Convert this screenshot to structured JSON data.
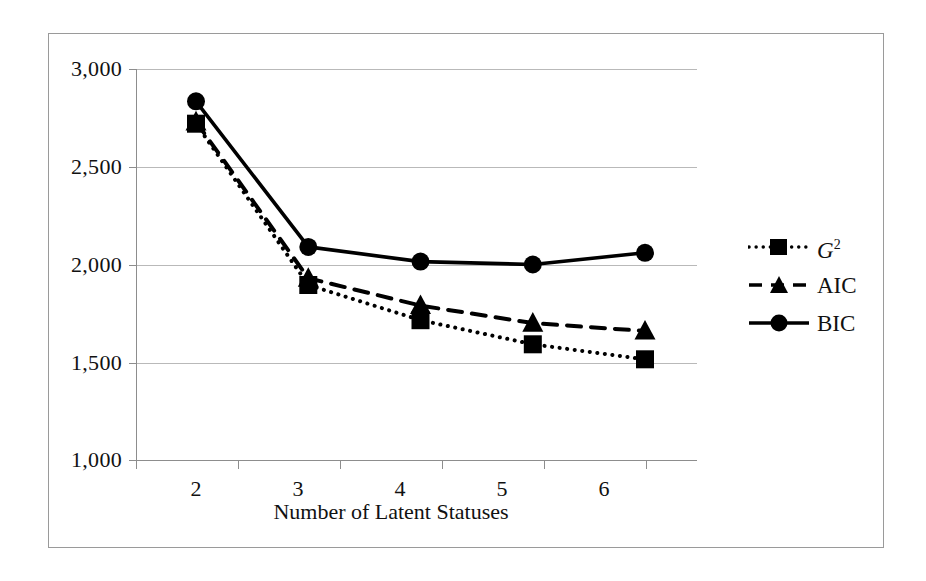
{
  "chart_data": {
    "type": "line",
    "title": "",
    "xlabel": "Number of Latent Statuses",
    "ylabel": "",
    "categories": [
      "2",
      "3",
      "4",
      "5",
      "6"
    ],
    "x": [
      2,
      3,
      4,
      5,
      6
    ],
    "ylim": [
      1000,
      3000
    ],
    "yticks": [
      1000,
      1500,
      2000,
      2500,
      3000
    ],
    "ytick_labels": [
      "1,000",
      "1,500",
      "2,000",
      "2,500",
      "3,000"
    ],
    "xtick_labels": [
      "2",
      "3",
      "4",
      "5",
      "6"
    ],
    "grid": true,
    "legend_position": "right",
    "series": [
      {
        "name": "G2",
        "label": "G",
        "label_superscript": "2",
        "values": [
          2720,
          1895,
          1715,
          1592,
          1515
        ],
        "line_style": "dotted",
        "marker": "square",
        "color": "#000000"
      },
      {
        "name": "AIC",
        "label": "AIC",
        "values": [
          2730,
          1930,
          1790,
          1700,
          1660
        ],
        "line_style": "dashed",
        "marker": "triangle",
        "color": "#000000"
      },
      {
        "name": "BIC",
        "label": "BIC",
        "values": [
          2835,
          2090,
          2015,
          2000,
          2060
        ],
        "line_style": "solid",
        "marker": "circle",
        "color": "#000000"
      }
    ]
  },
  "axis": {
    "y_labels": [
      "3,000",
      "2,500",
      "2,000",
      "1,500",
      "1,000"
    ],
    "x_labels": [
      "2",
      "3",
      "4",
      "5",
      "6"
    ],
    "x_title": "Number of Latent Statuses"
  },
  "legend": {
    "entries": [
      {
        "label": "G",
        "superscript": "2",
        "style": "dotted-square"
      },
      {
        "label": "AIC",
        "superscript": "",
        "style": "dashed-triangle"
      },
      {
        "label": "BIC",
        "superscript": "",
        "style": "solid-circle"
      }
    ]
  },
  "colors": {
    "ink": "#000000",
    "grid": "#b9b9b9",
    "axis": "#8d8d8d",
    "frame": "#9a9a9a",
    "background": "#ffffff"
  }
}
